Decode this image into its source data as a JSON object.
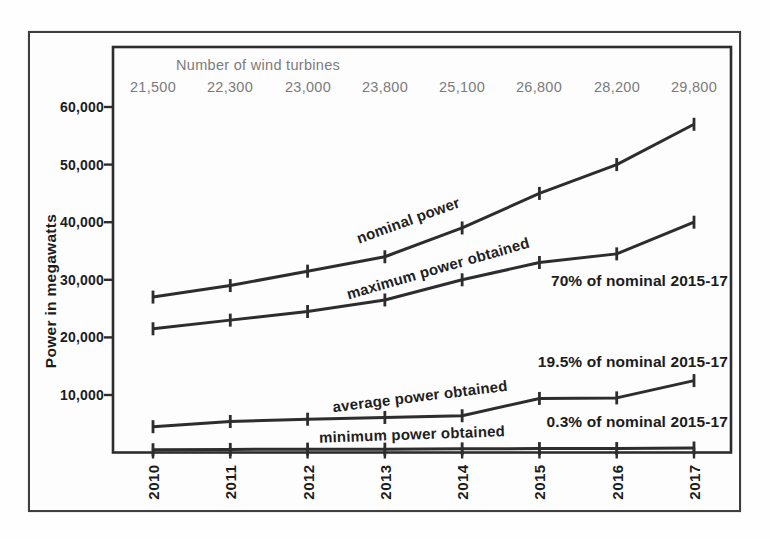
{
  "labels": {
    "turbines_header": "Number of wind turbines",
    "turbine_counts": [
      "21,500",
      "22,300",
      "23,000",
      "23,800",
      "25,100",
      "26,800",
      "28,200",
      "29,800"
    ],
    "y_axis_title": "Power in megawatts",
    "y_ticks": [
      "60,000",
      "50,000",
      "40,000",
      "30,000",
      "20,000",
      "10,000"
    ],
    "years": [
      "2010",
      "2011",
      "2012",
      "2013",
      "2014",
      "2015",
      "2016",
      "2017"
    ]
  },
  "chart_data": {
    "type": "line",
    "title": "",
    "x": [
      2010,
      2011,
      2012,
      2013,
      2014,
      2015,
      2016,
      2017
    ],
    "xlabel": "",
    "ylabel": "Power in megawatts",
    "ylim": [
      0,
      63000
    ],
    "y_tick_values": [
      60000,
      50000,
      40000,
      30000,
      20000,
      10000
    ],
    "grid": false,
    "legend": "inline-labels",
    "line_color": "#2d2d2d",
    "secondary_text_color": "#7b7b7b",
    "top_axis": {
      "label": "Number of wind turbines",
      "values": [
        21500,
        22300,
        23000,
        23800,
        25100,
        26800,
        28200,
        29800
      ]
    },
    "series": [
      {
        "name": "nominal power",
        "values": [
          27000,
          29000,
          31500,
          34000,
          39000,
          45000,
          50000,
          57000
        ]
      },
      {
        "name": "maximum power obtained",
        "values": [
          21500,
          23000,
          24500,
          26500,
          30000,
          33000,
          34500,
          40000
        ]
      },
      {
        "name": "average power obtained",
        "values": [
          4500,
          5400,
          5800,
          6100,
          6400,
          9400,
          9500,
          12500
        ]
      },
      {
        "name": "minimum power obtained",
        "values": [
          500,
          550,
          600,
          600,
          650,
          700,
          700,
          800
        ]
      }
    ],
    "annotations": [
      {
        "text": "70% of nominal 2015-17",
        "refers_to": "maximum power obtained"
      },
      {
        "text": "19.5% of nominal 2015-17",
        "refers_to": "average power obtained"
      },
      {
        "text": "0.3% of nominal 2015-17",
        "refers_to": "minimum power obtained"
      }
    ]
  }
}
